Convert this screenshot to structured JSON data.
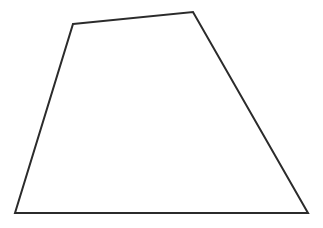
{
  "canvas": {
    "width": 323,
    "height": 228,
    "background_color": "#ffffff",
    "description": "Line drawing of a single closed quadrilateral (trapezoid-like shape)"
  },
  "figure": {
    "name": "quadrilateral",
    "shape_type": "trapezoid",
    "stroke_color": "#2b2b2b",
    "fill_color": "#ffffff",
    "stroke_width": 2,
    "closed": true,
    "vertex_count": 4,
    "vertices": [
      {
        "label": "top-left",
        "x": 73,
        "y": 24
      },
      {
        "label": "top-right",
        "x": 193,
        "y": 12
      },
      {
        "label": "bottom-right",
        "x": 308,
        "y": 213
      },
      {
        "label": "bottom-left",
        "x": 15,
        "y": 213
      }
    ],
    "edges": [
      {
        "label": "top-edge",
        "from": "top-left",
        "to": "top-right"
      },
      {
        "label": "right-edge",
        "from": "top-right",
        "to": "bottom-right"
      },
      {
        "label": "bottom-edge",
        "from": "bottom-right",
        "to": "bottom-left"
      },
      {
        "label": "left-edge",
        "from": "bottom-left",
        "to": "top-left"
      }
    ],
    "path": "M 73 24 L 193 12 L 308 213 L 15 213 Z"
  }
}
